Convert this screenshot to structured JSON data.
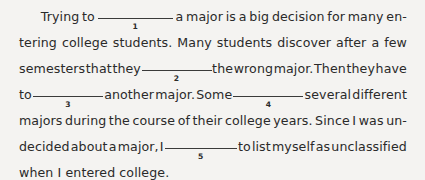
{
  "document": {
    "type": "cloze-exercise-paragraph",
    "background_color": "#f4f3f1",
    "text_color": "#2a2a2a",
    "rule_color": "#3a3a3a",
    "full_text": "Trying to ______1______ a major is a big decision for many entering college students. Many students discover after a few semesters that they ______2______ the wrong major. Then they have to ______3______ another major. Some ______4______ several different majors during the course of their college years. Since I was undecided about a major, I ______5______ to list myself as unclassified when I entered college.",
    "blank_count": 5,
    "lines": [
      {
        "id": "line-1",
        "indented": true,
        "justified": true,
        "parts": [
          {
            "kind": "text",
            "value": "Trying"
          },
          {
            "kind": "text",
            "value": "to"
          },
          {
            "kind": "blank",
            "value": "1",
            "width": 75
          },
          {
            "kind": "text",
            "value": "a"
          },
          {
            "kind": "text",
            "value": "major"
          },
          {
            "kind": "text",
            "value": "is"
          },
          {
            "kind": "text",
            "value": "a"
          },
          {
            "kind": "text",
            "value": "big"
          },
          {
            "kind": "text",
            "value": "decision"
          },
          {
            "kind": "text",
            "value": "for"
          },
          {
            "kind": "text",
            "value": "many"
          },
          {
            "kind": "text",
            "value": "en-"
          }
        ]
      },
      {
        "id": "line-2",
        "indented": false,
        "justified": true,
        "parts": [
          {
            "kind": "text",
            "value": "tering"
          },
          {
            "kind": "text",
            "value": "college"
          },
          {
            "kind": "text",
            "value": "students."
          },
          {
            "kind": "text",
            "value": "Many"
          },
          {
            "kind": "text",
            "value": "students"
          },
          {
            "kind": "text",
            "value": "discover"
          },
          {
            "kind": "text",
            "value": "after"
          },
          {
            "kind": "text",
            "value": "a"
          },
          {
            "kind": "text",
            "value": "few"
          }
        ]
      },
      {
        "id": "line-3",
        "indented": false,
        "justified": true,
        "parts": [
          {
            "kind": "text",
            "value": "semesters"
          },
          {
            "kind": "text",
            "value": "that"
          },
          {
            "kind": "text",
            "value": "they"
          },
          {
            "kind": "blank",
            "value": "2",
            "width": 70
          },
          {
            "kind": "text",
            "value": "the"
          },
          {
            "kind": "text",
            "value": "wrong"
          },
          {
            "kind": "text",
            "value": "major."
          },
          {
            "kind": "text",
            "value": "Then"
          },
          {
            "kind": "text",
            "value": "they"
          },
          {
            "kind": "text",
            "value": "have"
          }
        ]
      },
      {
        "id": "line-4",
        "indented": false,
        "justified": true,
        "parts": [
          {
            "kind": "text",
            "value": "to"
          },
          {
            "kind": "blank",
            "value": "3",
            "width": 70
          },
          {
            "kind": "text",
            "value": "another"
          },
          {
            "kind": "text",
            "value": "major."
          },
          {
            "kind": "text",
            "value": "Some"
          },
          {
            "kind": "blank",
            "value": "4",
            "width": 70
          },
          {
            "kind": "text",
            "value": "several"
          },
          {
            "kind": "text",
            "value": "different"
          }
        ]
      },
      {
        "id": "line-5",
        "indented": false,
        "justified": true,
        "parts": [
          {
            "kind": "text",
            "value": "majors"
          },
          {
            "kind": "text",
            "value": "during"
          },
          {
            "kind": "text",
            "value": "the"
          },
          {
            "kind": "text",
            "value": "course"
          },
          {
            "kind": "text",
            "value": "of"
          },
          {
            "kind": "text",
            "value": "their"
          },
          {
            "kind": "text",
            "value": "college"
          },
          {
            "kind": "text",
            "value": "years."
          },
          {
            "kind": "text",
            "value": "Since"
          },
          {
            "kind": "text",
            "value": "I"
          },
          {
            "kind": "text",
            "value": "was"
          },
          {
            "kind": "text",
            "value": "un-"
          }
        ]
      },
      {
        "id": "line-6",
        "indented": false,
        "justified": true,
        "parts": [
          {
            "kind": "text",
            "value": "decided"
          },
          {
            "kind": "text",
            "value": "about"
          },
          {
            "kind": "text",
            "value": "a"
          },
          {
            "kind": "text",
            "value": "major,"
          },
          {
            "kind": "text",
            "value": "I"
          },
          {
            "kind": "blank",
            "value": "5",
            "width": 72
          },
          {
            "kind": "text",
            "value": "to"
          },
          {
            "kind": "text",
            "value": "list"
          },
          {
            "kind": "text",
            "value": "myself"
          },
          {
            "kind": "text",
            "value": "as"
          },
          {
            "kind": "text",
            "value": "unclassified"
          }
        ]
      },
      {
        "id": "line-7",
        "indented": false,
        "justified": false,
        "parts": [
          {
            "kind": "text",
            "value": "when"
          },
          {
            "kind": "text",
            "value": "I"
          },
          {
            "kind": "text",
            "value": "entered"
          },
          {
            "kind": "text",
            "value": "college."
          }
        ]
      }
    ]
  }
}
